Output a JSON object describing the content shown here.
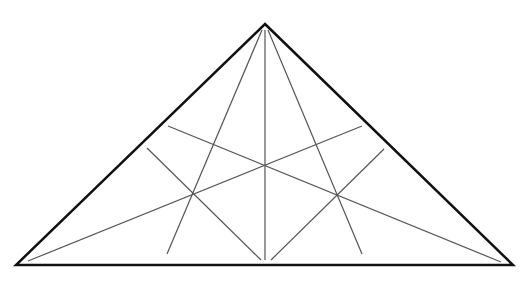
{
  "diagram": {
    "type": "geometric-figure",
    "background_color": "#ffffff",
    "triangle": {
      "vertices": {
        "apex": [
          265,
          24
        ],
        "bottom_left": [
          16,
          265
        ],
        "bottom_right": [
          513,
          265
        ]
      },
      "stroke_color": "#111111",
      "stroke_width": 2.5
    },
    "inner_lines": {
      "stroke_color": "#555555",
      "stroke_width": 1.2,
      "segments": [
        {
          "name": "vertical-median",
          "from": [
            265,
            30
          ],
          "to": [
            265,
            260
          ]
        },
        {
          "name": "apex-left-line",
          "from": [
            262,
            30
          ],
          "to": [
            167,
            254
          ]
        },
        {
          "name": "apex-right-line",
          "from": [
            268,
            30
          ],
          "to": [
            362,
            254
          ]
        },
        {
          "name": "left-to-right-diagonal",
          "from": [
            168,
            126
          ],
          "to": [
            501,
            262
          ]
        },
        {
          "name": "right-to-left-diagonal",
          "from": [
            362,
            126
          ],
          "to": [
            28,
            261
          ]
        },
        {
          "name": "left-side-to-base-line",
          "from": [
            147,
            148
          ],
          "to": [
            261,
            260
          ]
        },
        {
          "name": "right-side-to-base-line",
          "from": [
            384,
            149
          ],
          "to": [
            271,
            260
          ]
        }
      ]
    },
    "intersection_points": {
      "center": [
        265,
        166
      ],
      "upper_left": [
        215,
        145
      ],
      "upper_right": [
        315,
        145
      ],
      "lower_left": [
        193,
        195
      ],
      "lower_right": [
        337,
        196
      ]
    }
  }
}
